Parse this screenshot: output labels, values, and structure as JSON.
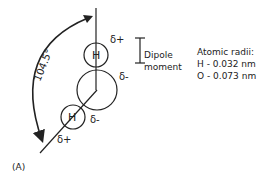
{
  "diagram": {
    "panel_label": "(A)",
    "angle_label": "104.5°",
    "atoms": {
      "top_h": "H",
      "bottom_h": "H"
    },
    "charges": {
      "top_h": "δ+",
      "oxygen": "δ-",
      "oxygen_lower": "δ-",
      "bottom_h": "δ+"
    },
    "dipole": {
      "line1": "Dipole",
      "line2": "moment"
    },
    "radii": {
      "title": "Atomic radii:",
      "h": "H - 0.032 nm",
      "o": "O - 0.073 nm"
    },
    "colors": {
      "stroke": "#222222",
      "background": "#ffffff"
    }
  }
}
